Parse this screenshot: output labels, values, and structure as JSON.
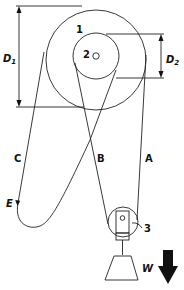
{
  "diagram": {
    "labels": {
      "pulley_large": "1",
      "pulley_small": "2",
      "pulley_lower": "3",
      "diameter_large": "D",
      "diameter_large_sub": "1",
      "diameter_small": "D",
      "diameter_small_sub": "2",
      "rope_a": "A",
      "rope_b": "B",
      "rope_c": "C",
      "end_e": "E",
      "weight": "W"
    },
    "colors": {
      "stroke": "#222222",
      "arrow": "#000000",
      "background": "#ffffff"
    }
  }
}
